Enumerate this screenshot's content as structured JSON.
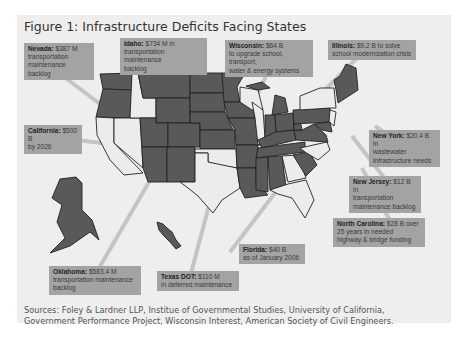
{
  "figure": {
    "title": "Figure 1: Infrastructure Deficits Facing States",
    "sources_line1": "Sources: Foley & Lardner LLP, Institue of Governmental Studies, University of California,",
    "sources_line2": "Government Performance Project, Wisconsin Interest, American Society of Civil Engineers.",
    "colors": {
      "background": "#eeeeee",
      "deficit_state": "#595959",
      "other_state": "#ececec",
      "callout": "#a3a3a3",
      "leader_line": "#bdbdbd",
      "border": "#222222"
    }
  },
  "callouts": {
    "nevada": {
      "state": "Nevada:",
      "amount": " $387 M",
      "l2": "transportation",
      "l3": "maintenance backlog"
    },
    "idaho": {
      "state": "Idaho:",
      "amount": " $734 M in",
      "l2": "transportation maintenance",
      "l3": "backlog"
    },
    "wisconsin": {
      "state": "Wisconsin:",
      "amount": " $64 B",
      "l2": "to upgrade school, transport,",
      "l3": "water & energy systems"
    },
    "illinois": {
      "state": "Illinois:",
      "amount": " $9.2 B to solve",
      "l2": "school modernization crisis"
    },
    "california": {
      "state": "California:",
      "amount": " $500 B",
      "l2": "by 2026"
    },
    "newyork": {
      "state": "New York:",
      "amount": " $20.4 B in",
      "l2": "wastewater",
      "l3": "infrastructure needs"
    },
    "newjersey": {
      "state": "New Jersey:",
      "amount": " $12 B in",
      "l2": "transportation",
      "l3": "maintenance backlog"
    },
    "northcarolina": {
      "state": "North Carolina:",
      "amount": " $28 B over",
      "l2": "25 years in needed",
      "l3": "highway & bridge funding"
    },
    "florida": {
      "state": "Florida:",
      "amount": " $40 B",
      "l2": "as of January 2006"
    },
    "oklahoma": {
      "state": "Oklahoma:",
      "amount": " $583.4 M",
      "l2": "transportation maintenance",
      "l3": "backlog"
    },
    "texas": {
      "state": "Texas DOT:",
      "amount": " $110 M",
      "l2": "in deferred maintenance"
    }
  }
}
